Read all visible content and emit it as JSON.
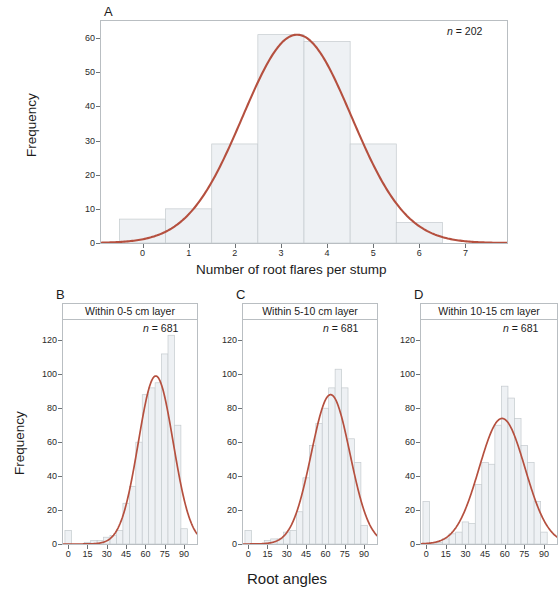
{
  "figure": {
    "background": "#ffffff",
    "curve_color": "#b5503f",
    "bar_fill": "#eef1f4",
    "bar_stroke": "#c4cace",
    "frame_color": "#b9bec2"
  },
  "panelA": {
    "letter": "A",
    "n_prefix": "n",
    "n_eq": " = ",
    "n_value": "202",
    "xlabel": "Number of root flares per stump",
    "ylabel": "Frequency",
    "yticks": [
      "0",
      "10",
      "20",
      "30",
      "40",
      "50",
      "60"
    ],
    "xticks": [
      "0",
      "1",
      "2",
      "3",
      "4",
      "5",
      "6",
      "7"
    ]
  },
  "panelB": {
    "letter": "B",
    "title": "Within 0-5 cm layer",
    "n_prefix": "n",
    "n_eq": " = ",
    "n_value": "681",
    "yticks": [
      "0",
      "20",
      "40",
      "60",
      "80",
      "100",
      "120"
    ],
    "xticks": [
      "0",
      "15",
      "30",
      "45",
      "60",
      "75",
      "90"
    ]
  },
  "panelC": {
    "letter": "C",
    "title": "Within 5-10 cm layer",
    "n_prefix": "n",
    "n_eq": " = ",
    "n_value": "681",
    "yticks": [
      "0",
      "20",
      "40",
      "60",
      "80",
      "100",
      "120"
    ],
    "xticks": [
      "0",
      "15",
      "30",
      "45",
      "60",
      "75",
      "90"
    ]
  },
  "panelD": {
    "letter": "D",
    "title": "Within 10-15 cm layer",
    "n_prefix": "n",
    "n_eq": " = ",
    "n_value": "681",
    "yticks": [
      "0",
      "20",
      "40",
      "60",
      "80",
      "100",
      "120"
    ],
    "xticks": [
      "0",
      "15",
      "30",
      "45",
      "60",
      "75",
      "90"
    ]
  },
  "bottom": {
    "xlabel": "Root angles",
    "ylabel": "Frequency"
  },
  "chart_data": [
    {
      "type": "bar",
      "panel": "A",
      "title": "Number of root flares per stump",
      "subtitle": "n = 202",
      "xlabel": "Number of root flares per stump",
      "ylabel": "Frequency",
      "xlim": [
        -0.9,
        7.9
      ],
      "ylim": [
        0,
        65
      ],
      "xticks": [
        0,
        1,
        2,
        3,
        4,
        5,
        6,
        7
      ],
      "yticks": [
        0,
        10,
        20,
        30,
        40,
        50,
        60
      ],
      "grid": false,
      "legend": "none",
      "bin_width": 1,
      "bin_centers": [
        0,
        1,
        2,
        3,
        4,
        5,
        6
      ],
      "categories": [
        "0",
        "1",
        "2",
        "3",
        "4",
        "5",
        "6"
      ],
      "values": [
        7,
        10,
        29,
        61,
        59,
        29,
        6
      ],
      "overlay": {
        "type": "line",
        "name": "normal fit",
        "color": "#b5503f",
        "mean": 3.35,
        "sd": 1.18,
        "peak": 61,
        "n": 202
      }
    },
    {
      "type": "bar",
      "panel": "B",
      "title": "Within 0-5 cm layer",
      "subtitle": "n = 681",
      "xlabel": "Root angles",
      "ylabel": "Frequency",
      "xlim": [
        -4,
        100
      ],
      "ylim": [
        0,
        132
      ],
      "xticks": [
        0,
        15,
        30,
        45,
        60,
        75,
        90
      ],
      "yticks": [
        0,
        20,
        40,
        60,
        80,
        100,
        120
      ],
      "grid": false,
      "legend": "none",
      "bin_width": 5,
      "bin_centers": [
        0,
        5,
        10,
        15,
        20,
        25,
        30,
        35,
        40,
        45,
        50,
        55,
        60,
        65,
        70,
        75,
        80,
        85,
        90
      ],
      "categories": [
        "0",
        "5",
        "10",
        "15",
        "20",
        "25",
        "30",
        "35",
        "40",
        "45",
        "50",
        "55",
        "60",
        "65",
        "70",
        "75",
        "80",
        "85",
        "90"
      ],
      "values": [
        8,
        0,
        0,
        1,
        2,
        2,
        4,
        5,
        8,
        24,
        34,
        60,
        88,
        92,
        95,
        112,
        123,
        70,
        9
      ],
      "overlay": {
        "type": "line",
        "name": "normal fit",
        "color": "#b5503f",
        "mean": 68,
        "sd": 13.5,
        "peak": 99,
        "n": 681
      }
    },
    {
      "type": "bar",
      "panel": "C",
      "title": "Within 5-10 cm layer",
      "subtitle": "n = 681",
      "xlabel": "Root angles",
      "ylabel": "Frequency",
      "xlim": [
        -4,
        100
      ],
      "ylim": [
        0,
        132
      ],
      "xticks": [
        0,
        15,
        30,
        45,
        60,
        75,
        90
      ],
      "yticks": [
        0,
        20,
        40,
        60,
        80,
        100,
        120
      ],
      "grid": false,
      "legend": "none",
      "bin_width": 5,
      "bin_centers": [
        0,
        5,
        10,
        15,
        20,
        25,
        30,
        35,
        40,
        45,
        50,
        55,
        60,
        65,
        70,
        75,
        80,
        85,
        90
      ],
      "categories": [
        "0",
        "5",
        "10",
        "15",
        "20",
        "25",
        "30",
        "35",
        "40",
        "45",
        "50",
        "55",
        "60",
        "65",
        "70",
        "75",
        "80",
        "85",
        "90"
      ],
      "values": [
        8,
        0,
        0,
        2,
        3,
        3,
        7,
        8,
        19,
        39,
        58,
        71,
        80,
        92,
        103,
        92,
        62,
        48,
        11
      ],
      "overlay": {
        "type": "line",
        "name": "normal fit",
        "color": "#b5503f",
        "mean": 64,
        "sd": 15,
        "peak": 88,
        "n": 681
      }
    },
    {
      "type": "bar",
      "panel": "D",
      "title": "Within 10-15 cm layer",
      "subtitle": "n = 681",
      "xlabel": "Root angles",
      "ylabel": "Frequency",
      "xlim": [
        -4,
        100
      ],
      "ylim": [
        0,
        132
      ],
      "xticks": [
        0,
        15,
        30,
        45,
        60,
        75,
        90
      ],
      "yticks": [
        0,
        20,
        40,
        60,
        80,
        100,
        120
      ],
      "grid": false,
      "legend": "none",
      "bin_width": 5,
      "bin_centers": [
        0,
        5,
        10,
        15,
        20,
        25,
        30,
        35,
        40,
        45,
        50,
        55,
        60,
        65,
        70,
        75,
        80,
        85,
        90
      ],
      "categories": [
        "0",
        "5",
        "10",
        "15",
        "20",
        "25",
        "30",
        "35",
        "40",
        "45",
        "50",
        "55",
        "60",
        "65",
        "70",
        "75",
        "80",
        "85",
        "90"
      ],
      "values": [
        25,
        1,
        1,
        3,
        6,
        7,
        13,
        12,
        35,
        48,
        47,
        70,
        93,
        86,
        74,
        58,
        48,
        25,
        7
      ],
      "overlay": {
        "type": "line",
        "name": "normal fit",
        "color": "#b5503f",
        "mean": 58,
        "sd": 17.5,
        "peak": 74,
        "n": 681
      }
    }
  ]
}
